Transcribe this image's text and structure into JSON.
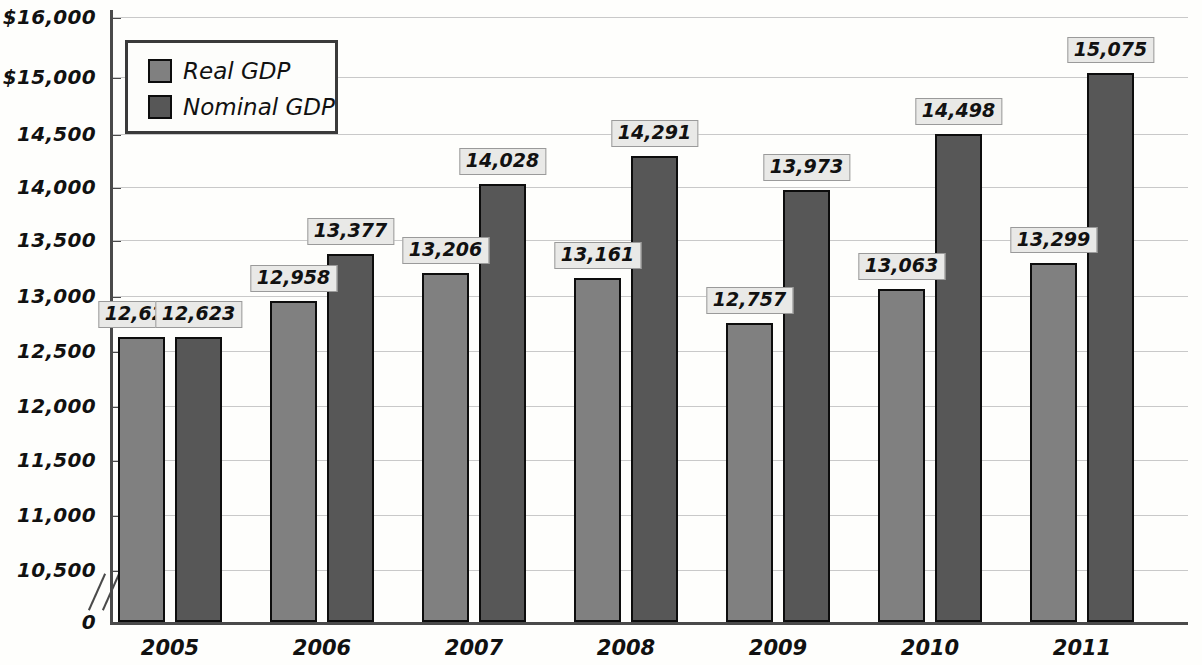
{
  "chart_data": {
    "type": "bar",
    "title": "",
    "xlabel": "",
    "ylabel": "",
    "categories": [
      "2005",
      "2006",
      "2007",
      "2008",
      "2009",
      "2010",
      "2011"
    ],
    "series": [
      {
        "name": "Real GDP",
        "color": "#808080",
        "values": [
          12623,
          12958,
          13206,
          13161,
          12757,
          13063,
          13299
        ],
        "labels": [
          "12,623",
          "12,958",
          "13,206",
          "13,161",
          "12,757",
          "13,063",
          "13,299"
        ]
      },
      {
        "name": "Nominal GDP",
        "color": "#575757",
        "values": [
          12623,
          13377,
          14028,
          14291,
          13973,
          14498,
          15075
        ],
        "labels": [
          "12,623",
          "13,377",
          "14,028",
          "14,291",
          "13,973",
          "14,498",
          "15,075"
        ]
      }
    ],
    "ylim": [
      10500,
      16000
    ],
    "y_axis_break": true,
    "y_axis_break_label": "0",
    "yticks": [
      {
        "value": 16000,
        "label": "$16,000",
        "y": 17
      },
      {
        "value": 15000,
        "label": "$15,000",
        "y": 77
      },
      {
        "value": 14500,
        "label": "14,500",
        "y": 134
      },
      {
        "value": 14000,
        "label": "14,000",
        "y": 187
      },
      {
        "value": 13500,
        "label": "13,500",
        "y": 240
      },
      {
        "value": 13000,
        "label": "13,000",
        "y": 296
      },
      {
        "value": 12500,
        "label": "12,500",
        "y": 351
      },
      {
        "value": 12000,
        "label": "12,000",
        "y": 406
      },
      {
        "value": 11500,
        "label": "11,500",
        "y": 460
      },
      {
        "value": 11000,
        "label": "11,000",
        "y": 515
      },
      {
        "value": 10500,
        "label": "10,500",
        "y": 570
      },
      {
        "value": 0,
        "label": "0",
        "y": 622
      }
    ],
    "grid": true,
    "legend_position": "top-left",
    "legend": [
      "Real GDP",
      "Nominal GDP"
    ]
  },
  "legend": {
    "real_label": "Real GDP",
    "nominal_label": "Nominal GDP"
  }
}
